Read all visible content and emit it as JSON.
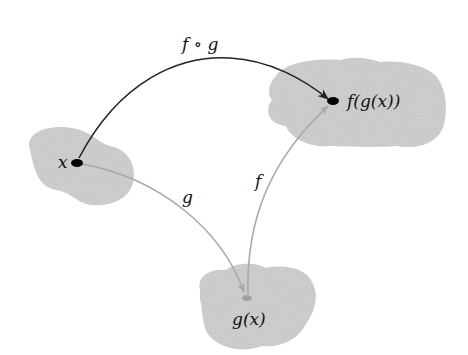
{
  "diagram": {
    "type": "function-composition",
    "nodes": {
      "x": {
        "label": "x"
      },
      "gx": {
        "label": "g(x)"
      },
      "fgx": {
        "label": "f(g(x))"
      }
    },
    "edges": {
      "composite": {
        "label": "f ∘ g",
        "from": "x",
        "to": "f(g(x))"
      },
      "g": {
        "label": "g",
        "from": "x",
        "to": "g(x)"
      },
      "f": {
        "label": "f",
        "from": "g(x)",
        "to": "f(g(x))"
      }
    },
    "colors": {
      "blob": "#d4d4d4",
      "composite_arrow": "#222222",
      "light_arrow": "#a8a8a8",
      "point": "#000000",
      "gx_point": "#a0a0a0"
    }
  }
}
